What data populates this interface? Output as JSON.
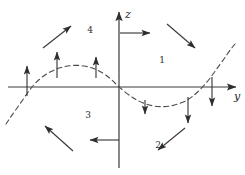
{
  "figure": {
    "type": "vector-field-phase-diagram",
    "background_color": "#ffffff",
    "line_color": "#3a3a3a",
    "curve_color": "#4a4a4a",
    "axes": {
      "horizontal": {
        "label": "y",
        "name": "y-axis",
        "y_position": 87,
        "x_start": 8,
        "x_end": 236,
        "arrow": "right"
      },
      "vertical": {
        "label": "z",
        "name": "z-axis",
        "x_position": 119,
        "y_start": 168,
        "y_end": 12,
        "arrow": "up"
      }
    },
    "quadrant_labels": [
      {
        "text": "1",
        "x": 162,
        "y": 63
      },
      {
        "text": "2",
        "x": 158,
        "y": 148
      },
      {
        "text": "3",
        "x": 88,
        "y": 118
      },
      {
        "text": "4",
        "x": 90,
        "y": 33
      }
    ],
    "nullcline": {
      "style": "dashed",
      "description": "sine-like dashed curve crossing the y-axis",
      "points": [
        [
          6,
          124
        ],
        [
          12,
          115
        ],
        [
          20,
          104
        ],
        [
          28,
          92
        ],
        [
          36,
          82
        ],
        [
          46,
          74
        ],
        [
          56,
          69
        ],
        [
          66,
          66
        ],
        [
          78,
          65
        ],
        [
          90,
          67
        ],
        [
          100,
          71
        ],
        [
          110,
          78
        ],
        [
          119,
          87
        ],
        [
          130,
          96
        ],
        [
          140,
          102
        ],
        [
          152,
          106
        ],
        [
          164,
          107
        ],
        [
          176,
          105
        ],
        [
          188,
          100
        ],
        [
          198,
          92
        ],
        [
          208,
          81
        ],
        [
          216,
          70
        ],
        [
          224,
          59
        ],
        [
          230,
          50
        ],
        [
          235,
          44
        ]
      ]
    },
    "field_arrows": [
      {
        "name": "arrow-up-far-left",
        "x1": 27,
        "y1": 96,
        "x2": 27,
        "y2": 66,
        "direction": "up"
      },
      {
        "name": "arrow-up-left",
        "x1": 57,
        "y1": 78,
        "x2": 57,
        "y2": 52,
        "direction": "up"
      },
      {
        "name": "arrow-up-left-inner",
        "x1": 96,
        "y1": 78,
        "x2": 96,
        "y2": 57,
        "direction": "up"
      },
      {
        "name": "arrow-down-right-inner",
        "x1": 145,
        "y1": 100,
        "x2": 145,
        "y2": 114,
        "direction": "down"
      },
      {
        "name": "arrow-down-right",
        "x1": 188,
        "y1": 97,
        "x2": 188,
        "y2": 123,
        "direction": "down"
      },
      {
        "name": "arrow-down-far-right",
        "x1": 212,
        "y1": 77,
        "x2": 212,
        "y2": 106,
        "direction": "down"
      },
      {
        "name": "arrow-right-on-z-axis",
        "x1": 120,
        "y1": 33,
        "x2": 150,
        "y2": 33,
        "direction": "right"
      },
      {
        "name": "arrow-left-on-z-axis",
        "x1": 119,
        "y1": 140,
        "x2": 90,
        "y2": 140,
        "direction": "left"
      },
      {
        "name": "arrow-diagonal-quadrant-4",
        "x1": 43,
        "y1": 48,
        "x2": 71,
        "y2": 26,
        "direction": "up-right"
      },
      {
        "name": "arrow-diagonal-quadrant-1",
        "x1": 167,
        "y1": 24,
        "x2": 195,
        "y2": 48,
        "direction": "down-right"
      },
      {
        "name": "arrow-diagonal-quadrant-2",
        "x1": 185,
        "y1": 128,
        "x2": 158,
        "y2": 150,
        "direction": "down-left"
      },
      {
        "name": "arrow-diagonal-quadrant-3",
        "x1": 73,
        "y1": 151,
        "x2": 45,
        "y2": 126,
        "direction": "up-left"
      }
    ]
  }
}
